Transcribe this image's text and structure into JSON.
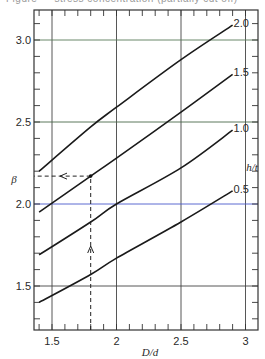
{
  "caption": "Figure — stress concentration (partially cut off)",
  "chart_data": {
    "type": "line",
    "title": "",
    "xlabel": "D/d",
    "ylabel": "β",
    "xlim": [
      1.35,
      3.2
    ],
    "ylim": [
      1.2,
      3.2
    ],
    "x_ticks": [
      "1.5",
      "2",
      "2.5",
      "3"
    ],
    "y_ticks": [
      "1.5",
      "2.0",
      "2.5",
      "3.0"
    ],
    "grid": true,
    "legend_title": "h/t",
    "series": [
      {
        "name": "2.0",
        "x": [
          1.4,
          1.8,
          2.0,
          2.5,
          2.9
        ],
        "values": [
          2.2,
          2.47,
          2.59,
          2.88,
          3.09
        ]
      },
      {
        "name": "1.5",
        "x": [
          1.4,
          1.8,
          2.0,
          2.5,
          2.9
        ],
        "values": [
          1.95,
          2.17,
          2.28,
          2.56,
          2.79
        ]
      },
      {
        "name": "1.0",
        "x": [
          1.4,
          1.8,
          2.0,
          2.5,
          2.9
        ],
        "values": [
          1.69,
          1.89,
          2.0,
          2.22,
          2.45
        ]
      },
      {
        "name": "0.5",
        "x": [
          1.4,
          1.8,
          2.0,
          2.5,
          2.9
        ],
        "values": [
          1.4,
          1.57,
          1.67,
          1.89,
          2.08
        ]
      }
    ],
    "annotations": [
      {
        "type": "dashed-arrow",
        "from": [
          1.8,
          1.2
        ],
        "to": [
          1.8,
          2.17
        ],
        "direction": "up"
      },
      {
        "type": "dashed-arrow",
        "from": [
          1.8,
          2.17
        ],
        "to": [
          1.4,
          2.17
        ],
        "direction": "left"
      }
    ]
  },
  "labels": {
    "ylabel": "β",
    "xlabel": "D/d",
    "legend_title": "h/t",
    "x_ticks": [
      "1.5",
      "2",
      "2.5",
      "3"
    ],
    "y_ticks": [
      "1.5",
      "2.0",
      "2.5",
      "3.0"
    ],
    "curves": [
      "2.0",
      "1.5",
      "1.0",
      "0.5"
    ]
  }
}
